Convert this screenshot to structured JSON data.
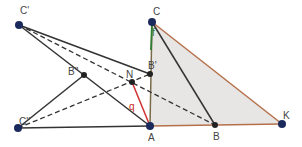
{
  "diagram": {
    "points": [
      {
        "name": "C'",
        "x": 19,
        "y": 25,
        "lx": 20,
        "ly": 14
      },
      {
        "name": "B''",
        "x": 84,
        "y": 75,
        "lx": 68,
        "ly": 75
      },
      {
        "name": "C''",
        "x": 18,
        "y": 128,
        "lx": 19,
        "ly": 125
      },
      {
        "name": "N",
        "x": 132,
        "y": 82,
        "lx": 126,
        "ly": 78
      },
      {
        "name": "B'",
        "x": 150,
        "y": 74,
        "lx": 148,
        "ly": 69
      },
      {
        "name": "A",
        "x": 150,
        "y": 126,
        "lx": 148,
        "ly": 141
      },
      {
        "name": "C",
        "x": 152,
        "y": 22,
        "lx": 153,
        "ly": 15
      },
      {
        "name": "B",
        "x": 215,
        "y": 125,
        "lx": 213,
        "ly": 140
      },
      {
        "name": "K",
        "x": 282,
        "y": 124,
        "lx": 283,
        "ly": 119
      }
    ],
    "segment_labels": [
      {
        "text": "f",
        "x": 152,
        "y": 36,
        "color": "#2e7d32"
      },
      {
        "text": "q",
        "x": 129,
        "y": 110,
        "color": "#c62828"
      }
    ],
    "colors": {
      "triangle_fill": "#e8e6e4",
      "triangle_edge": "#b5704a",
      "line": "#333333",
      "point": "#1a2a5c",
      "red": "#d03030",
      "green": "#2e7d32"
    }
  }
}
